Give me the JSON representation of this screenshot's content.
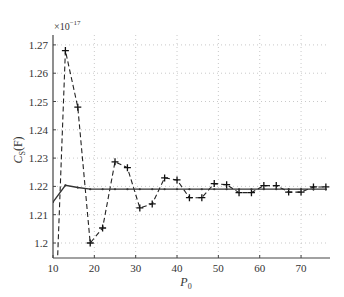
{
  "chart_data": {
    "type": "line",
    "title": "",
    "xlabel": "P0",
    "ylabel": "C_S (F)",
    "y_multiplier": "×10^-17",
    "xlim": [
      10,
      77
    ],
    "ylim": [
      1.1947,
      1.2735
    ],
    "grid": true,
    "legend": null,
    "x_ticks": [
      10,
      20,
      30,
      40,
      50,
      60,
      70
    ],
    "y_ticks": [
      1.2,
      1.21,
      1.22,
      1.23,
      1.24,
      1.25,
      1.26,
      1.27
    ],
    "y_tick_labels": [
      "1.2",
      "1.21",
      "1.22",
      "1.23",
      "1.24",
      "1.25",
      "1.26",
      "1.27"
    ],
    "series": [
      {
        "name": "dashed-plus",
        "style": "dashed",
        "marker": "+",
        "x": [
          11,
          13,
          16,
          19,
          22,
          25,
          28,
          31,
          34,
          37,
          40,
          43,
          46,
          49,
          52,
          55,
          58,
          61,
          64,
          67,
          70,
          73,
          76
        ],
        "values": [
          1.19,
          1.268,
          1.248,
          1.2,
          1.2053,
          1.2287,
          1.2266,
          1.2124,
          1.2138,
          1.223,
          1.2223,
          1.216,
          1.216,
          1.221,
          1.2206,
          1.2178,
          1.2178,
          1.2203,
          1.2203,
          1.218,
          1.218,
          1.2198,
          1.2198
        ]
      },
      {
        "name": "solid-dot",
        "style": "solid",
        "marker": ".",
        "x": [
          10,
          13,
          16,
          19,
          22,
          25,
          28,
          31,
          34,
          37,
          40,
          43,
          46,
          49,
          52,
          55,
          58,
          61,
          64,
          67,
          70,
          73,
          76
        ],
        "values": [
          1.2145,
          1.2204,
          1.2196,
          1.219,
          1.219,
          1.219,
          1.219,
          1.219,
          1.219,
          1.219,
          1.219,
          1.219,
          1.219,
          1.219,
          1.219,
          1.219,
          1.219,
          1.219,
          1.219,
          1.219,
          1.219,
          1.219,
          1.219
        ]
      }
    ]
  },
  "axes": {
    "x_label_main": "P",
    "x_label_sub": "0",
    "y_label_main": "C",
    "y_label_sub": "S",
    "y_label_unit": "(F)",
    "exponent_prefix": "×10",
    "exponent_power": "−17"
  }
}
